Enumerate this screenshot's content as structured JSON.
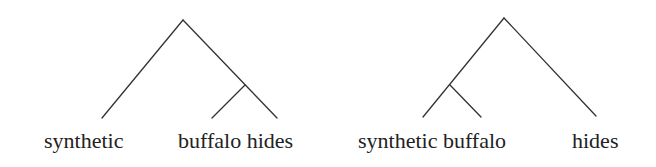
{
  "trees": [
    {
      "name": "bracketing-synthetic-[buffalo-hides]",
      "labels": {
        "left": "synthetic",
        "right": "buffalo hides"
      },
      "leaves": [
        "synthetic",
        "buffalo",
        "hides"
      ],
      "structure": "[synthetic [buffalo hides]]"
    },
    {
      "name": "bracketing-[synthetic-buffalo]-hides",
      "labels": {
        "left": "synthetic buffalo",
        "right": "hides"
      },
      "leaves": [
        "synthetic",
        "buffalo",
        "hides"
      ],
      "structure": "[[synthetic buffalo] hides]"
    }
  ],
  "colors": {
    "line": "#333333",
    "text": "#222222",
    "background": "#ffffff"
  }
}
